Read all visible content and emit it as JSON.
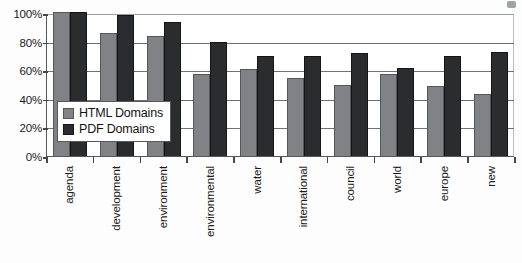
{
  "chart_data": {
    "type": "bar",
    "title": "",
    "xlabel": "",
    "ylabel": "",
    "ylim": [
      0,
      100
    ],
    "ytick_labels": [
      "100%",
      "80%",
      "60%",
      "40%",
      "20%",
      "0%"
    ],
    "ytick_values": [
      100,
      80,
      60,
      40,
      20,
      0
    ],
    "grid": true,
    "legend_position": "inside-left",
    "categories": [
      "agenda",
      "development",
      "environment",
      "environmental",
      "water",
      "international",
      "council",
      "world",
      "europe",
      "new"
    ],
    "series": [
      {
        "name": "HTML Domains",
        "color": "#808285",
        "values": [
          100,
          85,
          83,
          57,
          60,
          54,
          49,
          57,
          48,
          43
        ]
      },
      {
        "name": "PDF Domains",
        "color": "#2b2c2e",
        "values": [
          100,
          98,
          93,
          79,
          69,
          69,
          71,
          61,
          69,
          72
        ]
      }
    ]
  },
  "legend": {
    "items": [
      {
        "label": "HTML Domains",
        "swatch": "legend-swatch-html"
      },
      {
        "label": "PDF Domains",
        "swatch": "legend-swatch-pdf"
      }
    ]
  }
}
